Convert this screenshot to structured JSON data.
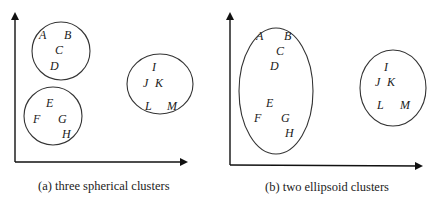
{
  "panels": [
    {
      "id": "a",
      "caption": "(a) three spherical clusters",
      "clusters": [
        {
          "shape": "circle",
          "points": [
            {
              "label": "A",
              "x": 43,
              "y": 35
            },
            {
              "label": "B",
              "x": 68,
              "y": 35
            },
            {
              "label": "C",
              "x": 59,
              "y": 50
            },
            {
              "label": "D",
              "x": 54,
              "y": 66
            }
          ]
        },
        {
          "shape": "circle",
          "points": [
            {
              "label": "E",
              "x": 50,
              "y": 103
            },
            {
              "label": "F",
              "x": 37,
              "y": 119
            },
            {
              "label": "G",
              "x": 62,
              "y": 119
            },
            {
              "label": "H",
              "x": 66,
              "y": 134
            }
          ]
        },
        {
          "shape": "circle",
          "points": [
            {
              "label": "I",
              "x": 154,
              "y": 67
            },
            {
              "label": "J",
              "x": 146,
              "y": 83
            },
            {
              "label": "K",
              "x": 159,
              "y": 83
            },
            {
              "label": "L",
              "x": 148,
              "y": 106
            },
            {
              "label": "M",
              "x": 172,
              "y": 106
            }
          ]
        }
      ]
    },
    {
      "id": "b",
      "caption": "(b) two ellipsoid clusters",
      "clusters": [
        {
          "shape": "ellipse",
          "points": [
            {
              "label": "A",
              "x": 260,
              "y": 40
            },
            {
              "label": "B",
              "x": 288,
              "y": 40
            },
            {
              "label": "C",
              "x": 280,
              "y": 55
            },
            {
              "label": "D",
              "x": 274,
              "y": 70
            },
            {
              "label": "E",
              "x": 269,
              "y": 107
            },
            {
              "label": "F",
              "x": 257,
              "y": 122
            },
            {
              "label": "G",
              "x": 284,
              "y": 122
            },
            {
              "label": "H",
              "x": 288,
              "y": 137
            }
          ]
        },
        {
          "shape": "circle",
          "points": [
            {
              "label": "I",
              "x": 385,
              "y": 71
            },
            {
              "label": "J",
              "x": 377,
              "y": 86
            },
            {
              "label": "K",
              "x": 390,
              "y": 86
            },
            {
              "label": "L",
              "x": 380,
              "y": 109
            },
            {
              "label": "M",
              "x": 404,
              "y": 109
            }
          ]
        }
      ]
    }
  ]
}
